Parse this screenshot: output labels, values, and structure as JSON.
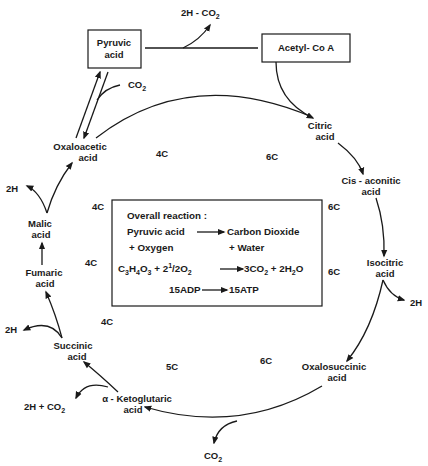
{
  "diagram": {
    "boxes": {
      "pyruvic": [
        "Pyruvic",
        "acid"
      ],
      "acetyl": "Acetyl- Co A"
    },
    "top_byproduct": "2H - CO2",
    "pyruvate_co2": "CO2",
    "nodes": {
      "oxaloacetic": [
        "Oxaloacetic",
        "acid"
      ],
      "citric": [
        "Citric",
        "acid"
      ],
      "cis_aconitic": [
        "Cis - aconitic",
        "acid"
      ],
      "isocitric": [
        "Isocitric",
        "acid"
      ],
      "oxalosuccinic": [
        "Oxalosuccinic",
        "acid"
      ],
      "ketoglutaric": [
        "α - Ketoglutaric",
        "acid"
      ],
      "succinic": [
        "Succinic",
        "acid"
      ],
      "fumaric": [
        "Fumaric",
        "acid"
      ],
      "malic": [
        "Malic",
        "acid"
      ]
    },
    "byproducts": {
      "malic_2h": "2H",
      "isocitric_2h": "2H",
      "succinic_2h": "2H",
      "ketoglutaric_2h_co2": "2H + CO2",
      "oxalosuccinic_co2": "CO2"
    },
    "carbon_counts": {
      "c1": "4C",
      "c2": "6C",
      "c3": "4C",
      "c4": "6C",
      "c5": "4C",
      "c6": "6C",
      "c7": "4C",
      "c8": "5C",
      "c9": "6C"
    },
    "overall_box": {
      "heading": "Overall reaction :",
      "line1_left": "Pyruvic  acid",
      "line1_right": "Carbon Dioxide",
      "line2_left": "+ Oxygen",
      "line2_right": "+ Water",
      "equation": "C3H4O3 + 2½O2 → 3CO2 + 2H2O",
      "atp_left": "15ADP",
      "atp_right": "15ATP"
    }
  }
}
